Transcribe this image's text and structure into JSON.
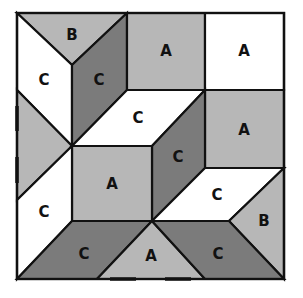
{
  "colors": {
    "light": "#b7b7b7",
    "dark": "#7b7b7b",
    "white": "#ffffff",
    "line": "#111111"
  },
  "pieces": [
    {
      "id": "b-top-triangle",
      "label": "B",
      "shade": "light",
      "points": "17,13 127,13 72,65",
      "lx": 72,
      "ly": 35
    },
    {
      "id": "c-top-left-white",
      "label": "C",
      "shade": "white",
      "points": "17,13 72,65 72,146 17,90",
      "lx": 44,
      "ly": 80
    },
    {
      "id": "c-top-dark",
      "label": "C",
      "shade": "dark",
      "points": "127,13 127,90 72,146 72,65",
      "lx": 99,
      "ly": 80
    },
    {
      "id": "a-top-middle",
      "label": "A",
      "shade": "light",
      "points": "127,13 205,13 205,90 127,90",
      "lx": 166,
      "ly": 51
    },
    {
      "id": "a-top-right-white",
      "label": "A",
      "shade": "white",
      "points": "205,13 284,13 284,90 205,90",
      "lx": 244,
      "ly": 51
    },
    {
      "id": "left-triangle",
      "label": "",
      "shade": "light",
      "points": "17,90 72,146 17,200",
      "lx": 35,
      "ly": 146
    },
    {
      "id": "c-middle-white",
      "label": "C",
      "shade": "white",
      "points": "72,146 127,90 205,90 152,146",
      "lx": 138,
      "ly": 118
    },
    {
      "id": "a-middle-right",
      "label": "A",
      "shade": "light",
      "points": "205,90 284,90 284,168 205,168",
      "lx": 244,
      "ly": 130
    },
    {
      "id": "c-center-dark",
      "label": "C",
      "shade": "dark",
      "points": "152,146 205,90 205,168 152,221",
      "lx": 178,
      "ly": 157
    },
    {
      "id": "a-center",
      "label": "A",
      "shade": "light",
      "points": "72,146 152,146 152,221 72,221",
      "lx": 112,
      "ly": 184
    },
    {
      "id": "c-bottom-left-white",
      "label": "C",
      "shade": "white",
      "points": "72,146 72,221 17,279 17,200",
      "lx": 44,
      "ly": 212
    },
    {
      "id": "c-lower-right-white",
      "label": "C",
      "shade": "white",
      "points": "152,221 205,168 284,168 229,221",
      "lx": 217,
      "ly": 195
    },
    {
      "id": "b-right-triangle",
      "label": "B",
      "shade": "light",
      "points": "284,168 229,221 284,279",
      "lx": 264,
      "ly": 221
    },
    {
      "id": "c-bottom-left-dark",
      "label": "C",
      "shade": "dark",
      "points": "72,221 152,221 97,279 17,279",
      "lx": 84,
      "ly": 254
    },
    {
      "id": "a-bottom-triangle",
      "label": "A",
      "shade": "light",
      "points": "152,221 205,279 97,279",
      "lx": 151,
      "ly": 256
    },
    {
      "id": "c-bottom-right-dark",
      "label": "C",
      "shade": "dark",
      "points": "152,221 229,221 284,279 205,279",
      "lx": 218,
      "ly": 254
    }
  ],
  "dashes": [
    {
      "x1": 17,
      "y1": 106,
      "x2": 17,
      "y2": 131
    },
    {
      "x1": 17,
      "y1": 157,
      "x2": 17,
      "y2": 183
    },
    {
      "x1": 110,
      "y1": 279,
      "x2": 136,
      "y2": 279
    },
    {
      "x1": 165,
      "y1": 279,
      "x2": 191,
      "y2": 279
    }
  ],
  "outline": {
    "x": 17,
    "y": 13,
    "width": 267,
    "height": 266
  }
}
